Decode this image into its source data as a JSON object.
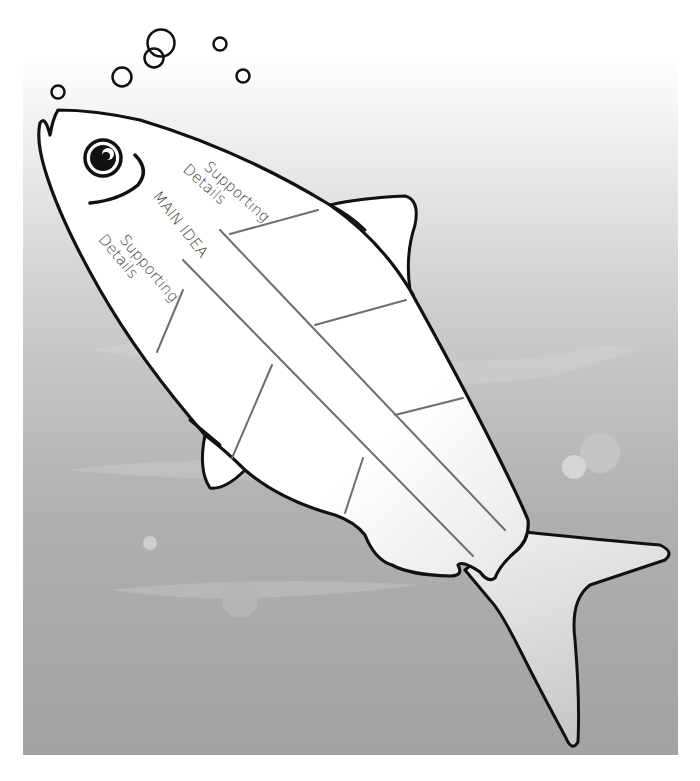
{
  "diagram": {
    "labels": {
      "supporting_top_line1": "Supporting",
      "supporting_top_line2": "Details",
      "main_idea": "MAIN IDEA",
      "supporting_bottom_line1": "Supporting",
      "supporting_bottom_line2": "Details"
    },
    "colors": {
      "background_top": "#ffffff",
      "background_bottom": "#a3a3a3",
      "fish_fill": "#ffffff",
      "outline": "#111111",
      "spine_lines": "#6e6e6e",
      "text": "#333333"
    }
  }
}
